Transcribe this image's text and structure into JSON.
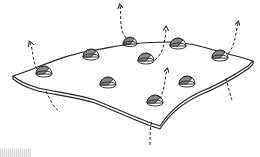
{
  "figure": {
    "dome_count": 9,
    "arrow_count": 7,
    "colors": {
      "line": "#222222",
      "dome_shade": "#8a8a8a",
      "background": "#ffffff"
    }
  }
}
